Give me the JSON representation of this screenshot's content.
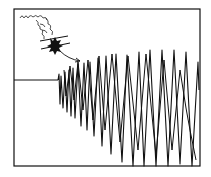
{
  "illustration": {
    "subject": "Hand-drawn sketch of an explosion above a seismograph trace showing a sudden large oscillation",
    "ink_color": "#111111",
    "paper_color": "#ffffff",
    "elements": {
      "frame": "drawn rectangular border",
      "smoke": "curly smoke puffs trailing up-left",
      "explosion": "dark burst with crossed lines",
      "arrow": "curved arrow pointing from explosion to onset of waveform",
      "baseline": "flat horizontal line before onset",
      "waveform": "growing zig-zag oscillation"
    }
  }
}
